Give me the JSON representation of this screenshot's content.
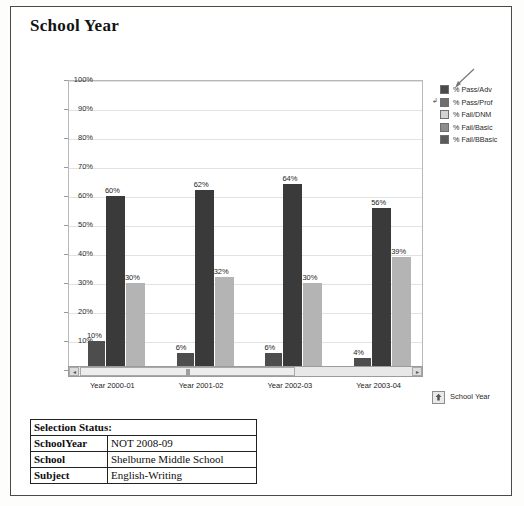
{
  "page": {
    "title": "School Year"
  },
  "chart_data": {
    "type": "bar",
    "title": "School Year",
    "xlabel": "",
    "ylabel": "",
    "ylim": [
      0,
      100
    ],
    "grid": true,
    "legend_position": "right",
    "categories": [
      "Year 2000-01",
      "Year 2001-02",
      "Year 2002-03",
      "Year 2003-04"
    ],
    "ytick_labels": [
      "100%",
      "90%",
      "80%",
      "70%",
      "60%",
      "50%",
      "40%",
      "30%",
      "20%",
      "10%",
      "0%"
    ],
    "ytick_values": [
      100,
      90,
      80,
      70,
      60,
      50,
      40,
      30,
      20,
      10,
      0
    ],
    "series": [
      {
        "name": "% Pass/Adv",
        "color": "#4d4d4d",
        "values": [
          10,
          6,
          6,
          4
        ],
        "labels": [
          "10%",
          "6%",
          "6%",
          "4%"
        ]
      },
      {
        "name": "% Pass/Prof",
        "color": "#3a3a3a",
        "values": [
          60,
          62,
          64,
          56
        ],
        "labels": [
          "60%",
          "62%",
          "64%",
          "56%"
        ]
      },
      {
        "name": "% Fail/DNM",
        "color": "#b4b4b4",
        "values": [
          30,
          32,
          30,
          39
        ],
        "labels": [
          "30%",
          "32%",
          "30%",
          "39%"
        ]
      }
    ],
    "legend": [
      {
        "label": "% Pass/Adv",
        "color": "#4a4a4a"
      },
      {
        "label": "% Pass/Prof",
        "color": "#6f6f6f"
      },
      {
        "label": "% Fail/DNM",
        "color": "#d2d2d2"
      },
      {
        "label": "% Fail/Basic",
        "color": "#8d8d8d"
      },
      {
        "label": "% Fail/BBasic",
        "color": "#5a5a5a"
      }
    ]
  },
  "scrollbar": {
    "left_arrow": "◂",
    "right_arrow": "▸"
  },
  "axis_note": {
    "left_marker": "↲"
  },
  "school_year_button": {
    "label": "School Year",
    "icon": "up-arrow-icon"
  },
  "status": {
    "header": "Selection Status:",
    "rows": [
      {
        "key": "SchoolYear",
        "value": "NOT 2008-09"
      },
      {
        "key": "School",
        "value": "Shelburne Middle School"
      },
      {
        "key": "Subject",
        "value": "English-Writing"
      }
    ]
  }
}
